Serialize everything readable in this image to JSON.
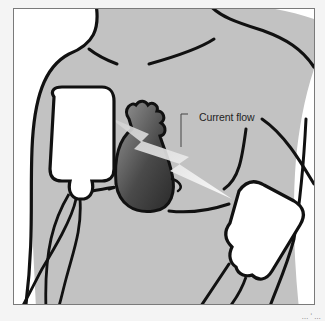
{
  "diagram": {
    "labels": {
      "current_flow": "Current flow"
    },
    "colors": {
      "skin": "#c2c2c2",
      "outline": "#111111",
      "pad": "#ffffff",
      "heart_dark": "#3a3a3a",
      "heart_light": "#8a8a8a",
      "bolt": "#e8e8e8",
      "background": "#f4f4f4"
    },
    "elements": [
      "torso",
      "heart",
      "paddle-right-chest",
      "paddle-left-side",
      "current-bolt",
      "paddle-cables"
    ]
  },
  "credit": "… ʻ …"
}
